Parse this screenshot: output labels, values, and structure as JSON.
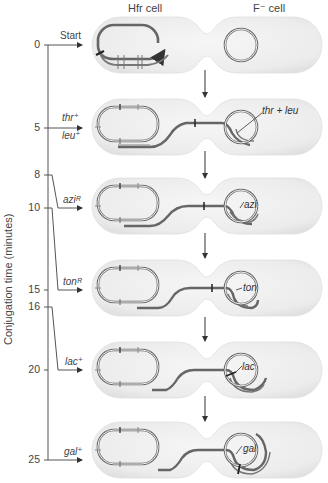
{
  "header": {
    "donor_label": "Hfr cell",
    "recipient_label": "F⁻ cell"
  },
  "axis": {
    "label": "Conjugation time (minutes)",
    "ticks": [
      "0",
      "5",
      "8",
      "10",
      "15",
      "16",
      "20",
      "25"
    ]
  },
  "stages": [
    {
      "time": "0",
      "marker": "Start",
      "recipient_gene": ""
    },
    {
      "time": "5",
      "marker": "thr⁺ / leu⁺",
      "marker_top": "thr⁺",
      "marker_bottom": "leu⁺",
      "recipient_gene": "thr + leu"
    },
    {
      "time": "10",
      "marker": "aziᴿ",
      "recipient_gene": "azi"
    },
    {
      "time": "15",
      "marker": "tonᴿ",
      "recipient_gene": "ton"
    },
    {
      "time": "20",
      "marker": "lac⁺",
      "recipient_gene": "lac"
    },
    {
      "time": "25",
      "marker": "gal⁺",
      "recipient_gene": "gal"
    }
  ],
  "colors": {
    "cell_fill": "#efefef",
    "cell_edge": "#e2e2e2",
    "dna": "#555555",
    "arrow": "#333333"
  }
}
